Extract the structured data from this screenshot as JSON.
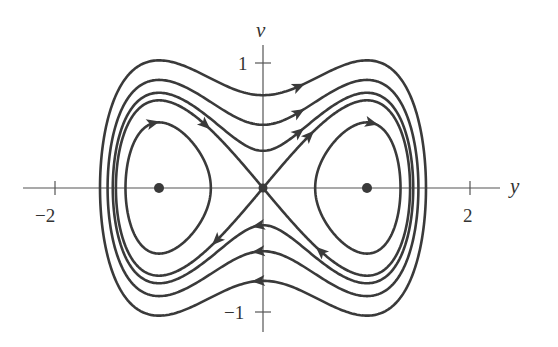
{
  "chart_data": {
    "type": "phase-portrait",
    "title": "",
    "xlabel": "y",
    "ylabel": "v",
    "xlim": [
      -2.3,
      2.3
    ],
    "ylim": [
      -1.15,
      1.15
    ],
    "grid": false,
    "x_ticks": [
      {
        "value": -2,
        "label": "−2"
      },
      {
        "value": 2,
        "label": "2"
      }
    ],
    "y_ticks": [
      {
        "value": 1,
        "label": "1"
      },
      {
        "value": -1,
        "label": "−1"
      }
    ],
    "equilibria": [
      {
        "y": -1,
        "v": 0,
        "type": "center"
      },
      {
        "y": 0,
        "v": 0,
        "type": "saddle"
      },
      {
        "y": 1,
        "v": 0,
        "type": "center"
      }
    ],
    "hamiltonian": "H = v^2/2 - y^2/2 + y^4/4",
    "level_curves": [
      {
        "H": -0.11,
        "kind": "inner-loop",
        "side": "left",
        "direction": "clockwise"
      },
      {
        "H": -0.11,
        "kind": "inner-loop",
        "side": "right",
        "direction": "clockwise"
      },
      {
        "H": 0.0,
        "kind": "separatrix"
      },
      {
        "H": 0.045,
        "kind": "outer-orbit",
        "direction": "clockwise"
      },
      {
        "H": 0.13,
        "kind": "outer-orbit",
        "direction": "clockwise"
      },
      {
        "H": 0.28,
        "kind": "outer-orbit",
        "direction": "clockwise"
      }
    ]
  },
  "axes": {
    "horizontal_label": "y",
    "vertical_label": "v",
    "tick_neg2": "−2",
    "tick_pos2": "2",
    "tick_pos1": "1",
    "tick_neg1": "−1"
  },
  "colors": {
    "curve": "#3a3a3a",
    "axis": "#555555",
    "background": "#ffffff"
  },
  "mapping": {
    "origin_px": [
      263,
      188
    ],
    "px_per_unit_x": 104,
    "px_per_unit_y": 124
  }
}
